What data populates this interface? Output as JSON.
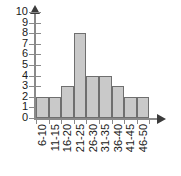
{
  "chart_data": {
    "type": "bar",
    "title": "",
    "subtitle": "",
    "xlabel": "",
    "ylabel": "",
    "categories": [
      "6-10",
      "11-15",
      "16-20",
      "21-25",
      "26-30",
      "31-35",
      "36-40",
      "41-45",
      "46-50"
    ],
    "values": [
      2,
      2,
      3,
      8,
      4,
      4,
      3,
      2,
      2
    ],
    "ylim": [
      0,
      10
    ],
    "y_ticks": [
      "0",
      "1",
      "2",
      "3",
      "4",
      "5",
      "6",
      "7",
      "8",
      "9",
      "10"
    ],
    "grid": false,
    "legend": null,
    "legend_position": "none",
    "annotations": [],
    "colors": {
      "bar_fill": "#c9c9c9",
      "bar_border": "#6f6f6f",
      "axis": "#8a8a8a",
      "arrow": "#3b3b3b",
      "text": "#1a1a1a",
      "background": "#ffffff"
    },
    "axes": {
      "y_arrow_icon": "arrow-up-icon",
      "x_arrow_icon": "arrow-right-icon",
      "x_tick_count": 10,
      "x_label_rotation": "-90"
    }
  }
}
